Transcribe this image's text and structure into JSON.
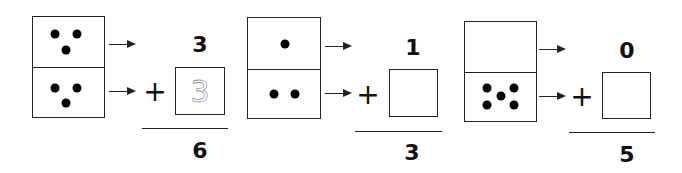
{
  "worksheet": {
    "problems": [
      {
        "domino": {
          "top_pips": 3,
          "bottom_pips": 3
        },
        "top_number": "3",
        "operator": "+",
        "answer_box_value": "3",
        "answer_box_style": "traced",
        "sum": "6"
      },
      {
        "domino": {
          "top_pips": 1,
          "bottom_pips": 2
        },
        "top_number": "1",
        "operator": "+",
        "answer_box_value": "",
        "answer_box_style": "empty",
        "sum": "3"
      },
      {
        "domino": {
          "top_pips": 0,
          "bottom_pips": 5
        },
        "top_number": "0",
        "operator": "+",
        "answer_box_value": "",
        "answer_box_style": "empty",
        "sum": "5"
      }
    ]
  },
  "icons": {
    "arrow": "right-arrow-icon",
    "pip": "domino-pip-icon"
  },
  "colors": {
    "ink": "#222222",
    "trace": "#999999",
    "background": "#ffffff"
  }
}
